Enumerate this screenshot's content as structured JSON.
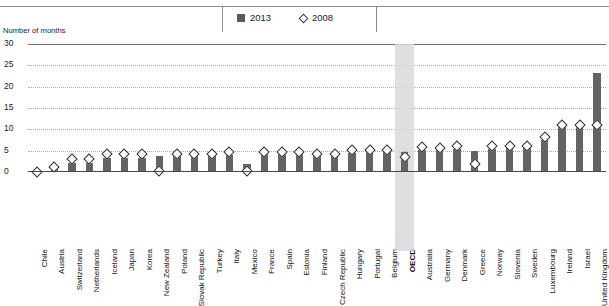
{
  "chart_data": {
    "type": "bar",
    "title": "",
    "subtitle": "",
    "xlabel": "",
    "ylabel": "Number of months",
    "ylim": [
      0,
      30
    ],
    "yticks": [
      0,
      5,
      10,
      15,
      20,
      25,
      30
    ],
    "grid": true,
    "legend_position": "top-center",
    "highlight_category": "OECD",
    "categories": [
      "Chile",
      "Austria",
      "Switzerland",
      "Netherlands",
      "Iceland",
      "Japan",
      "Korea",
      "New Zealand",
      "Poland",
      "Slovak Republic",
      "Turkey",
      "Italy",
      "Mexico",
      "France",
      "Spain",
      "Estonia",
      "Finland",
      "Czech Republic",
      "Hungary",
      "Portugal",
      "Belgium",
      "OECD",
      "Australia",
      "Germany",
      "Denmark",
      "Greece",
      "Norway",
      "Slovenia",
      "Sweden",
      "Luxembourg",
      "Ireland",
      "Israel",
      "United Kingdom"
    ],
    "series": [
      {
        "name": "2013",
        "marker": "square",
        "color": "#636363",
        "values": [
          0,
          0.8,
          2.2,
          2.2,
          3.3,
          3.3,
          3.3,
          3.7,
          3.7,
          3.8,
          3.9,
          4.0,
          1.9,
          4.2,
          4.3,
          4.3,
          4.4,
          4.4,
          4.5,
          4.6,
          4.6,
          4.6,
          5.1,
          5.2,
          5.3,
          4.9,
          5.5,
          5.6,
          5.8,
          7.4,
          10.9,
          11.0,
          23.3
        ]
      },
      {
        "name": "2008",
        "marker": "diamond",
        "color": "#ffffff",
        "values": [
          0.1,
          1.1,
          3.0,
          3.0,
          4.2,
          4.2,
          4.2,
          0.2,
          4.2,
          4.3,
          4.2,
          4.6,
          0.2,
          4.8,
          4.8,
          4.8,
          4.2,
          4.2,
          5.2,
          5.1,
          5.2,
          3.6,
          5.8,
          5.6,
          6.0,
          1.8,
          6.0,
          6.0,
          6.2,
          8.2,
          10.9,
          11.0,
          11.0
        ]
      }
    ]
  },
  "legend": {
    "entries": [
      {
        "label": "2013",
        "marker": "square"
      },
      {
        "label": "2008",
        "marker": "diamond"
      }
    ]
  },
  "axis": {
    "title": "Number of months"
  }
}
